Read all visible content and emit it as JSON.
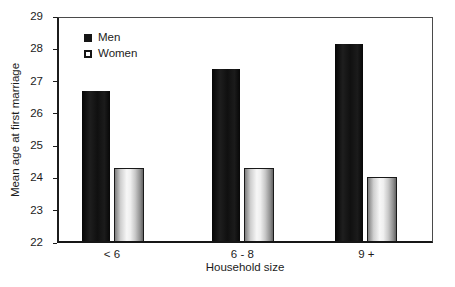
{
  "figure": {
    "width_px": 455,
    "height_px": 287
  },
  "chart_data": {
    "type": "bar",
    "title": "",
    "categories": [
      "< 6",
      "6 - 8",
      "9 +"
    ],
    "series": [
      {
        "name": "Men",
        "values": [
          26.7,
          27.4,
          28.2
        ],
        "swatch": "filled-black-square"
      },
      {
        "name": "Women",
        "values": [
          24.3,
          24.3,
          24.0
        ],
        "swatch": "open-white-square"
      }
    ],
    "xlabel": "Household size",
    "ylabel": "Mean age at first marriage",
    "ylim": [
      22,
      29
    ],
    "yticks": [
      29,
      28,
      27,
      26,
      25,
      24,
      23,
      22
    ],
    "grid": false,
    "legend_position": "top-left-inside",
    "group_centers_pct": [
      14.6,
      49.3,
      82.3
    ]
  },
  "colors": {
    "men_bar": "#141414",
    "women_bar_highlight": "#f7f7f7",
    "women_bar_edge": "#636363",
    "frame": "#4a4a4a",
    "axis": "#1c1c1c",
    "text": "#1c1c1c",
    "background": "#ffffff"
  }
}
